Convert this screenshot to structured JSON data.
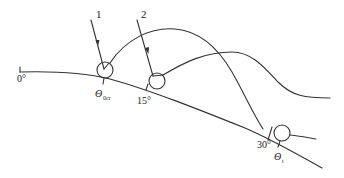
{
  "diagram": {
    "type": "trajectory-on-slope",
    "colors": {
      "line": "#333333",
      "text": "#222222",
      "background": "#ffffff"
    },
    "labels": {
      "angle_start": "0°",
      "theta_cr_main": "Θ",
      "theta_cr_sub": "0cr",
      "angle_mid": "15°",
      "angle_end": "30°",
      "theta_t_main": "Θ",
      "theta_t_sub": "t",
      "arrow1": "1",
      "arrow2": "2"
    },
    "elements": [
      {
        "id": "slope-line",
        "description": "curved slope from 0° flat to ~30° incline"
      },
      {
        "id": "ball-1",
        "description": "circle at Θ0cr position, impacted by arrow 1"
      },
      {
        "id": "ball-2",
        "description": "circle at 15° position, impacted by arrow 2"
      },
      {
        "id": "ball-3",
        "description": "circle at 30° position, Θt"
      },
      {
        "id": "trajectory-1",
        "description": "arc from ball 1 over to ball 3"
      },
      {
        "id": "trajectory-2",
        "description": "arc from ball 2 leveling off to right"
      }
    ]
  }
}
